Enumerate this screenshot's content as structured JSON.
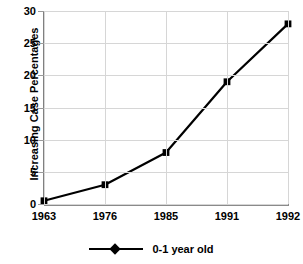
{
  "chart_data": {
    "type": "line",
    "title": "",
    "xlabel": "",
    "ylabel": "Increasing Case Percentages",
    "categories": [
      "1963",
      "1976",
      "1985",
      "1991",
      "1992"
    ],
    "series": [
      {
        "name": "0-1 year old",
        "values": [
          0.5,
          3,
          8,
          19,
          28
        ],
        "color": "#000000",
        "marker": "square"
      }
    ],
    "ylim": [
      0,
      30
    ],
    "yticks": [
      0,
      5,
      10,
      15,
      20,
      25,
      30
    ],
    "ytick_labels": [
      "0",
      "5",
      "10",
      "15",
      "20",
      "25",
      "30"
    ],
    "grid": "both",
    "grid_color": "#d6d6d6",
    "axis_color": "#808080",
    "legend_position": "bottom"
  },
  "legend": {
    "entries": [
      {
        "label": "0-1 year old"
      }
    ]
  }
}
